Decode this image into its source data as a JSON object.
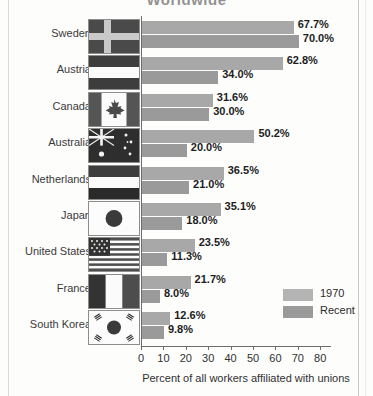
{
  "title": "Worldwide",
  "chart_data": {
    "type": "bar",
    "orientation": "horizontal",
    "title": "Worldwide",
    "xlabel": "Percent of all workers affiliated with unions",
    "ylabel": "",
    "xlim": [
      0,
      85
    ],
    "xticks": [
      0,
      10,
      20,
      30,
      40,
      50,
      60,
      70,
      80
    ],
    "grid": false,
    "legend_position": "right-bottom",
    "categories": [
      "Sweden",
      "Austria",
      "Canada",
      "Australia",
      "Netherlands",
      "Japan",
      "United States",
      "France",
      "South Korea"
    ],
    "series": [
      {
        "name": "1970",
        "values": [
          67.7,
          62.8,
          31.6,
          50.2,
          36.5,
          35.1,
          23.5,
          21.7,
          12.6
        ],
        "labels": [
          "67.7%",
          "62.8%",
          "31.6%",
          "50.2%",
          "36.5%",
          "35.1%",
          "23.5%",
          "21.7%",
          "12.6%"
        ],
        "color": "#a8a8a8"
      },
      {
        "name": "Recent",
        "values": [
          70.0,
          34.0,
          30.0,
          20.0,
          21.0,
          18.0,
          11.3,
          8.0,
          9.8
        ],
        "labels": [
          "70.0%",
          "34.0%",
          "30.0%",
          "20.0%",
          "21.0%",
          "18.0%",
          "11.3%",
          "8.0%",
          "9.8%"
        ],
        "color": "#9a9a9a"
      }
    ]
  },
  "rows": [
    {
      "country": "Sweden",
      "flag": "flag-sweden",
      "old": 67.7,
      "old_label": "67.7%",
      "recent": 70.0,
      "recent_label": "70.0%"
    },
    {
      "country": "Austria",
      "flag": "flag-austria",
      "old": 62.8,
      "old_label": "62.8%",
      "recent": 34.0,
      "recent_label": "34.0%"
    },
    {
      "country": "Canada",
      "flag": "flag-canada",
      "old": 31.6,
      "old_label": "31.6%",
      "recent": 30.0,
      "recent_label": "30.0%"
    },
    {
      "country": "Australia",
      "flag": "flag-australia",
      "old": 50.2,
      "old_label": "50.2%",
      "recent": 20.0,
      "recent_label": "20.0%"
    },
    {
      "country": "Netherlands",
      "flag": "flag-netherlands",
      "old": 36.5,
      "old_label": "36.5%",
      "recent": 21.0,
      "recent_label": "21.0%"
    },
    {
      "country": "Japan",
      "flag": "flag-japan",
      "old": 35.1,
      "old_label": "35.1%",
      "recent": 18.0,
      "recent_label": "18.0%"
    },
    {
      "country": "United States",
      "flag": "flag-united-states",
      "old": 23.5,
      "old_label": "23.5%",
      "recent": 11.3,
      "recent_label": "11.3%"
    },
    {
      "country": "France",
      "flag": "flag-france",
      "old": 21.7,
      "old_label": "21.7%",
      "recent": 8.0,
      "recent_label": "8.0%"
    },
    {
      "country": "South Korea",
      "flag": "flag-south-korea",
      "old": 12.6,
      "old_label": "12.6%",
      "recent": 9.8,
      "recent_label": "9.8%"
    }
  ],
  "xaxis": {
    "ticks": [
      "0",
      "10",
      "20",
      "30",
      "40",
      "50",
      "60",
      "70",
      "80"
    ],
    "label": "Percent of all workers affiliated with unions"
  },
  "legend": [
    {
      "key": "old",
      "label": "1970",
      "color": "#b4b4b4"
    },
    {
      "key": "recent",
      "label": "Recent",
      "color": "#9a9a9a"
    }
  ],
  "colors": {
    "bar_1970": "#a8a8a8",
    "bar_recent": "#9a9a9a",
    "axis": "#6d6d6d",
    "text": "#2b2b2b",
    "background": "#fdfdfc"
  }
}
